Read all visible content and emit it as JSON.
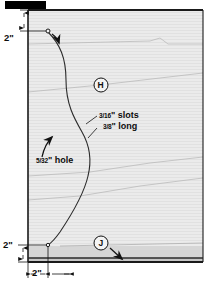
{
  "drawing": {
    "title_bar": {
      "name": "black-title-bar",
      "color": "#000000"
    },
    "panel": {
      "fill_light": "#e9e9e9",
      "fill_band": "#cfcfcf",
      "grain_color": "#b9b9b9",
      "edge_color": "#1a1a1a"
    },
    "dimensions": [
      {
        "id": "top-left-vertical",
        "label": "2\"",
        "orientation": "vertical"
      },
      {
        "id": "bottom-left-vertical",
        "label": "2\"",
        "orientation": "vertical"
      },
      {
        "id": "bottom-horizontal",
        "label": "2\"",
        "orientation": "horizontal"
      }
    ],
    "callouts": [
      {
        "id": "slots",
        "line1_numerator": "3",
        "line1_denominator": "16",
        "line1_text": "\" slots",
        "line2_numerator": "3",
        "line2_denominator": "8",
        "line2_text": "\" long",
        "full_text": "3/16\" slots 3/8\" long"
      },
      {
        "id": "hole",
        "numerator": "5",
        "denominator": "32",
        "text": "\" hole",
        "full_text": "5/32\" hole"
      }
    ],
    "part_markers": [
      {
        "id": "marker-h",
        "label": "H"
      },
      {
        "id": "marker-j",
        "label": "J"
      }
    ],
    "curve": {
      "name": "s-curve-profile",
      "stroke": "#2b2b2b"
    },
    "pivot_hole": {
      "name": "pivot-hole-top",
      "label": ""
    }
  }
}
